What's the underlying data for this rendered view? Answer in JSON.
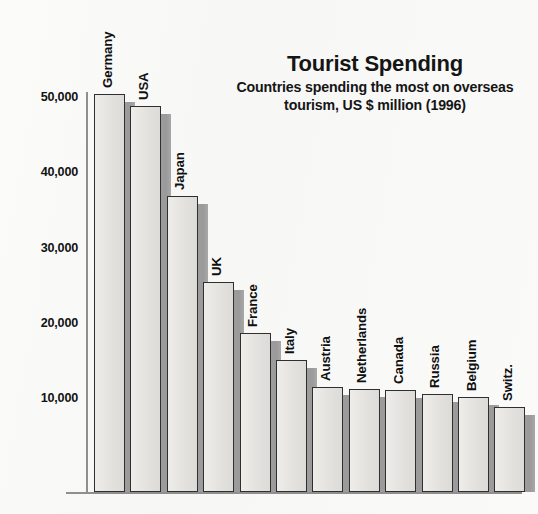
{
  "chart_data": {
    "type": "bar",
    "title": "Tourist Spending",
    "subtitle": "Countries spending the most on overseas tourism, US $ million (1996)",
    "xlabel": "",
    "ylabel": "",
    "ylim": [
      0,
      52000
    ],
    "grid": false,
    "legend": "none",
    "unit": "US $ million",
    "year": "1996",
    "ytick_labels": [
      "10,000",
      "20,000",
      "30,000",
      "40,000",
      "50,000"
    ],
    "ytick_values": [
      10000,
      20000,
      30000,
      40000,
      50000
    ],
    "categories": [
      "Germany",
      "USA",
      "Japan",
      "UK",
      "France",
      "Italy",
      "Austria",
      "Netherlands",
      "Canada",
      "Russia",
      "Belgium",
      "Switz."
    ],
    "values": [
      50400,
      48800,
      36900,
      25400,
      18600,
      15000,
      11500,
      11200,
      11000,
      10600,
      10200,
      8800
    ],
    "bar_style": {
      "face_color": "#e6e5e2",
      "edge_color": "#2f2f2f",
      "shadow_color": "#9d9d9d",
      "three_d": true
    }
  },
  "figure": {
    "background_color": "#fbfbfa",
    "axis_color": "#8f8f8f",
    "text_color": "#121212"
  }
}
